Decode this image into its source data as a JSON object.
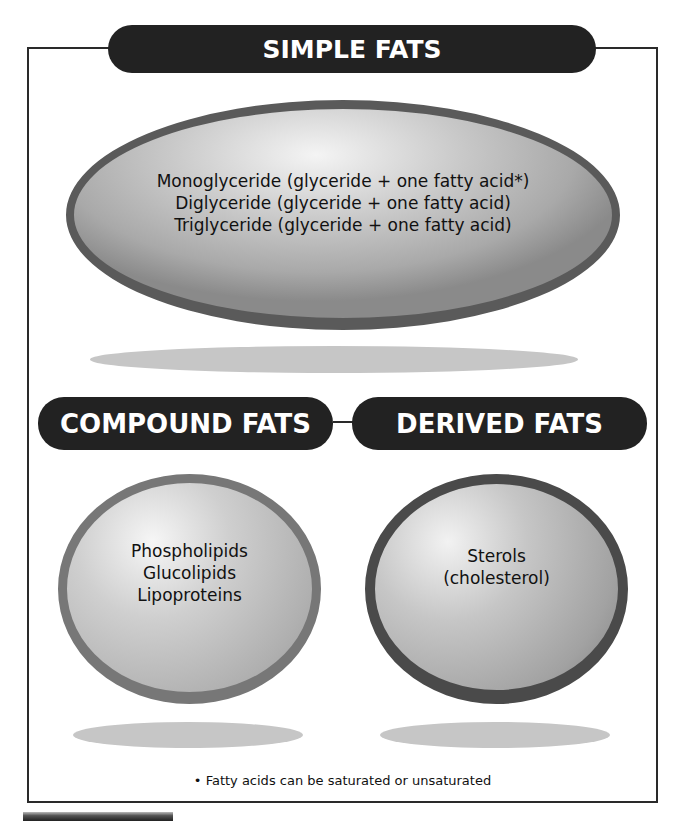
{
  "diagram": {
    "categories": [
      {
        "id": "simple",
        "header": "SIMPLE FATS",
        "items": [
          "Monoglyceride (glyceride + one fatty acid*)",
          "Diglyceride (glyceride + one fatty acid)",
          "Triglyceride (glyceride + one fatty acid)"
        ]
      },
      {
        "id": "compound",
        "header": "COMPOUND FATS",
        "items": [
          "Phospholipids",
          "Glucolipids",
          "Lipoproteins"
        ]
      },
      {
        "id": "derived",
        "header": "DERIVED FATS",
        "items": [
          "Sterols",
          "(cholesterol)"
        ]
      }
    ],
    "footnote": "• Fatty acids can be saturated or unsaturated"
  },
  "colors": {
    "header_fill": "#222222",
    "header_text": "#ffffff",
    "frame_line": "#2a2a2a",
    "ellipse_fill": "#c0c0c0",
    "shadow_fill": "#c6c6c6"
  }
}
